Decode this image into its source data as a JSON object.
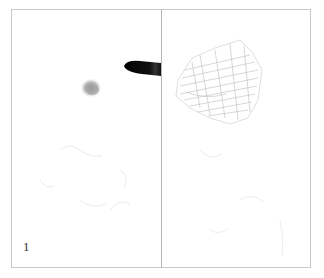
{
  "figure": {
    "panel_label": "1",
    "panels": [
      {
        "id": "left",
        "description": "pen tip over smudge on paper with faint traces"
      },
      {
        "id": "right",
        "description": "faint pencil hatched sketch shape with faint traces"
      }
    ]
  },
  "colors": {
    "border": "#c9c9c9",
    "divider": "#b5b5b5",
    "pen": "#111111",
    "smudge": "#9a9a9a",
    "sketch": "#bdbdbd"
  }
}
